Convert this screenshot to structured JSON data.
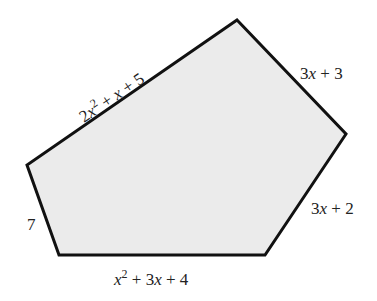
{
  "diagram": {
    "type": "pentagon",
    "fill_color": "#ebebeb",
    "stroke_color": "#111111",
    "vertices": [
      [
        237,
        20
      ],
      [
        346,
        134
      ],
      [
        265,
        255
      ],
      [
        59,
        255
      ],
      [
        27,
        165
      ]
    ],
    "sides": {
      "top_left": {
        "coef": "2",
        "var": "x",
        "exp": "2",
        "rest": " + ",
        "var2": "x",
        "tail": " + 5"
      },
      "top_right": {
        "pre": "3",
        "var": "x",
        "tail": " + 3"
      },
      "bottom_right": {
        "pre": "3",
        "var": "x",
        "tail": " + 2"
      },
      "bottom": {
        "var": "x",
        "exp": "2",
        "mid": " + 3",
        "var2": "x",
        "tail": " + 4"
      },
      "left": {
        "value": "7"
      }
    }
  }
}
